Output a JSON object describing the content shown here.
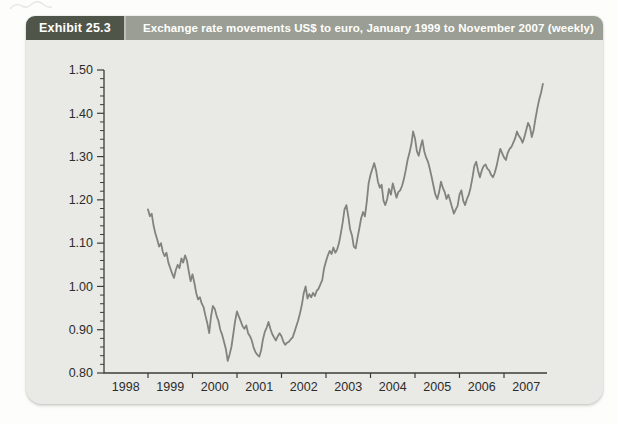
{
  "page": {
    "background": "#fdfdfb"
  },
  "header": {
    "exhibit_label": "Exhibit 25.3",
    "title": "Exchange rate movements US$ to euro, January 1999 to November 2007 (weekly)",
    "badge_bg": "#50554a",
    "bar_bg": "#9b9e94",
    "text_color": "#ffffff"
  },
  "panel": {
    "background": "#e9e9e6"
  },
  "chart_data": {
    "type": "line",
    "title": "Exchange rate movements US$ to euro, January 1999 to November 2007 (weekly)",
    "xlabel": "",
    "ylabel": "",
    "grid": false,
    "legend": false,
    "axis_color": "#3c3c3a",
    "x_axis": {
      "labels": [
        "1998",
        "1999",
        "2000",
        "2001",
        "2002",
        "2003",
        "2004",
        "2005",
        "2006",
        "2007"
      ],
      "tick_boundary_years": [
        1999,
        2000,
        2001,
        2002,
        2003,
        2004,
        2005,
        2006,
        2007
      ],
      "range_years": [
        1997.97,
        2007.97
      ]
    },
    "y_axis": {
      "tick_labels": [
        "1.50",
        "1.40",
        "1.30",
        "1.20",
        "1.10",
        "1.00",
        "0.90",
        "0.80"
      ],
      "tick_values": [
        1.5,
        1.4,
        1.3,
        1.2,
        1.1,
        1.0,
        0.9,
        0.8
      ],
      "minor_step": 0.02,
      "range": [
        0.8,
        1.5
      ]
    },
    "series": [
      {
        "name": "US dollars per euro (weekly)",
        "color": "#82827e",
        "x_start": 1999.0,
        "x_step": 0.0416667,
        "values": [
          1.178,
          1.162,
          1.168,
          1.14,
          1.122,
          1.108,
          1.092,
          1.1,
          1.08,
          1.07,
          1.078,
          1.055,
          1.042,
          1.03,
          1.02,
          1.038,
          1.05,
          1.042,
          1.065,
          1.055,
          1.072,
          1.06,
          1.035,
          1.012,
          1.028,
          1.008,
          0.985,
          0.97,
          0.975,
          0.96,
          0.952,
          0.932,
          0.915,
          0.892,
          0.93,
          0.955,
          0.948,
          0.932,
          0.92,
          0.9,
          0.888,
          0.872,
          0.855,
          0.828,
          0.843,
          0.86,
          0.89,
          0.92,
          0.942,
          0.93,
          0.92,
          0.908,
          0.902,
          0.91,
          0.892,
          0.885,
          0.875,
          0.858,
          0.848,
          0.842,
          0.838,
          0.852,
          0.878,
          0.895,
          0.905,
          0.918,
          0.902,
          0.89,
          0.882,
          0.875,
          0.885,
          0.892,
          0.885,
          0.872,
          0.865,
          0.87,
          0.872,
          0.878,
          0.882,
          0.895,
          0.908,
          0.922,
          0.938,
          0.958,
          0.985,
          1.0,
          0.972,
          0.982,
          0.975,
          0.985,
          0.978,
          0.99,
          0.995,
          1.005,
          1.015,
          1.042,
          1.058,
          1.072,
          1.082,
          1.075,
          1.09,
          1.078,
          1.085,
          1.1,
          1.122,
          1.148,
          1.178,
          1.188,
          1.162,
          1.132,
          1.118,
          1.092,
          1.088,
          1.112,
          1.135,
          1.158,
          1.172,
          1.162,
          1.196,
          1.238,
          1.258,
          1.272,
          1.285,
          1.268,
          1.242,
          1.228,
          1.235,
          1.198,
          1.188,
          1.202,
          1.225,
          1.212,
          1.238,
          1.222,
          1.205,
          1.218,
          1.222,
          1.232,
          1.248,
          1.268,
          1.292,
          1.308,
          1.328,
          1.358,
          1.342,
          1.312,
          1.302,
          1.322,
          1.338,
          1.312,
          1.298,
          1.288,
          1.272,
          1.252,
          1.232,
          1.212,
          1.202,
          1.218,
          1.242,
          1.228,
          1.218,
          1.202,
          1.212,
          1.198,
          1.182,
          1.168,
          1.178,
          1.186,
          1.212,
          1.222,
          1.198,
          1.188,
          1.202,
          1.212,
          1.228,
          1.252,
          1.278,
          1.288,
          1.268,
          1.252,
          1.268,
          1.278,
          1.282,
          1.272,
          1.268,
          1.258,
          1.252,
          1.262,
          1.278,
          1.298,
          1.318,
          1.308,
          1.298,
          1.292,
          1.308,
          1.318,
          1.322,
          1.332,
          1.342,
          1.358,
          1.348,
          1.342,
          1.332,
          1.345,
          1.362,
          1.378,
          1.368,
          1.345,
          1.362,
          1.388,
          1.412,
          1.432,
          1.448,
          1.468
        ]
      }
    ]
  }
}
